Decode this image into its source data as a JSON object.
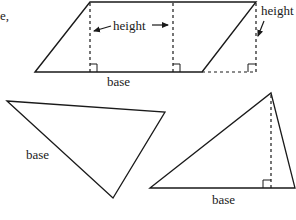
{
  "fragment_text": "e,",
  "parallelogram": {
    "height_label_left": "height",
    "height_label_right": "height",
    "base_label": "base"
  },
  "left_triangle": {
    "base_label": "base"
  },
  "right_triangle": {
    "base_label": "base"
  },
  "colors": {
    "line": "#1a1a1a",
    "background": "#ffffff"
  }
}
